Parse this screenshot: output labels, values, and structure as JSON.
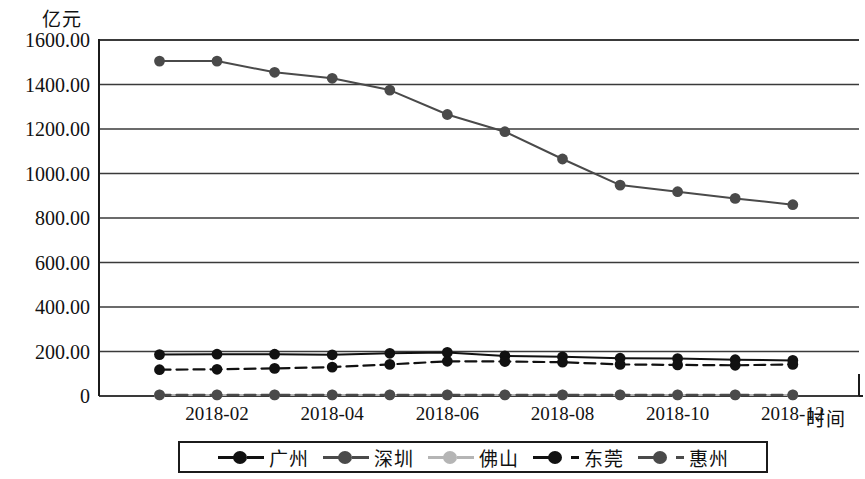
{
  "chart_data": {
    "type": "line",
    "title": "",
    "subtitle": "",
    "ylabel": "亿元",
    "xlabel": "时间",
    "ylim": [
      0,
      1600
    ],
    "ytick_labels": [
      "1600.00",
      "1400.00",
      "1200.00",
      "1000.00",
      "800.00",
      "600.00",
      "400.00",
      "200.00",
      "0"
    ],
    "ytick_values": [
      1600,
      1400,
      1200,
      1000,
      800,
      600,
      400,
      200,
      0
    ],
    "grid": true,
    "legend_position": "bottom",
    "x": [
      "2018-01",
      "2018-02",
      "2018-03",
      "2018-04",
      "2018-05",
      "2018-06",
      "2018-07",
      "2018-08",
      "2018-09",
      "2018-10",
      "2018-11",
      "2018-12"
    ],
    "xtick_labels": [
      "2018-02",
      "2018-04",
      "2018-06",
      "2018-08",
      "2018-10",
      "2018-12"
    ],
    "xtick_indices": [
      1,
      3,
      5,
      7,
      9,
      11
    ],
    "series": [
      {
        "name": "广州",
        "color": "#111111",
        "style": "solid",
        "marker": "circle",
        "values": [
          186,
          188,
          188,
          185,
          192,
          196,
          180,
          176,
          170,
          168,
          163,
          160
        ]
      },
      {
        "name": "深圳",
        "color": "#4a4a4a",
        "style": "solid",
        "marker": "circle",
        "values": [
          1505,
          1505,
          1455,
          1428,
          1375,
          1265,
          1188,
          1065,
          948,
          918,
          888,
          860
        ]
      },
      {
        "name": "佛山",
        "color": "#b5b5b5",
        "style": "solid",
        "marker": "circle",
        "values": [
          5,
          5,
          5,
          5,
          5,
          5,
          5,
          5,
          5,
          5,
          5,
          5
        ]
      },
      {
        "name": "东莞",
        "color": "#111111",
        "style": "dashed",
        "marker": "circle",
        "values": [
          118,
          120,
          124,
          130,
          142,
          156,
          155,
          152,
          142,
          140,
          138,
          142
        ]
      },
      {
        "name": "惠州",
        "color": "#4a4a4a",
        "style": "dashed",
        "marker": "circle",
        "values": [
          5,
          5,
          5,
          5,
          5,
          5,
          5,
          5,
          5,
          5,
          5,
          5
        ]
      }
    ]
  },
  "axes": {
    "y_unit": "亿元",
    "x_title": "时间"
  },
  "legend": {
    "items": [
      {
        "label": "广州",
        "color": "#111111",
        "style": "solid"
      },
      {
        "label": "深圳",
        "color": "#4a4a4a",
        "style": "solid"
      },
      {
        "label": "佛山",
        "color": "#b5b5b5",
        "style": "solid"
      },
      {
        "label": "东莞",
        "color": "#111111",
        "style": "dashed"
      },
      {
        "label": "惠州",
        "color": "#4a4a4a",
        "style": "dashed"
      }
    ]
  },
  "colors": {
    "axis": "#1b1b1b",
    "grid": "#3a3a3a",
    "background": "#ffffff"
  }
}
